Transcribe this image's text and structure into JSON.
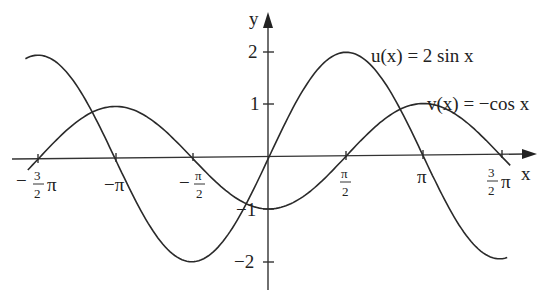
{
  "chart_data": {
    "type": "line",
    "title": "",
    "xlabel": "x",
    "ylabel": "y",
    "xlim": [
      -4.87,
      4.89
    ],
    "ylim": [
      -2.5,
      2.2
    ],
    "grid": false,
    "legend": "inline labels",
    "x_ticks": [
      {
        "value": -4.712,
        "num": "3",
        "den": "2",
        "label": "-3/2 π"
      },
      {
        "value": -3.1416,
        "label": "−π"
      },
      {
        "value": -1.5708,
        "num": "π",
        "den": "2",
        "label": "-π/2"
      },
      {
        "value": 1.5708,
        "num": "π",
        "den": "2",
        "label": "π/2"
      },
      {
        "value": 3.1416,
        "label": "π"
      },
      {
        "value": 4.712,
        "num": "3",
        "den": "2",
        "label": "3/2 π"
      }
    ],
    "y_ticks": [
      {
        "value": 2,
        "label": "2"
      },
      {
        "value": 1,
        "label": "1"
      },
      {
        "value": -1,
        "label": "−1"
      },
      {
        "value": -2,
        "label": "−2"
      }
    ],
    "series": [
      {
        "name": "u(x) = 2 sin x",
        "function": "2*sin(x)",
        "x_range": [
          -4.97,
          4.86
        ],
        "points": [
          [
            -4.712,
            2
          ],
          [
            -3.1416,
            0
          ],
          [
            -1.5708,
            -2
          ],
          [
            0,
            0
          ],
          [
            1.5708,
            2
          ],
          [
            3.1416,
            0
          ],
          [
            4.712,
            -2
          ]
        ]
      },
      {
        "name": "v(x) = −cos x",
        "function": "-cos(x)",
        "x_range": [
          -4.92,
          4.92
        ],
        "points": [
          [
            -4.712,
            0
          ],
          [
            -3.1416,
            1
          ],
          [
            -1.5708,
            0
          ],
          [
            0,
            -1
          ],
          [
            1.5708,
            0
          ],
          [
            3.1416,
            1
          ],
          [
            4.712,
            0
          ]
        ]
      }
    ],
    "labels": {
      "u": "u(x) = 2 sin x",
      "v": "v(x) = −cos x"
    }
  },
  "axis": {
    "x_label": "x",
    "y_label": "y",
    "tick_neg_3pi2_sign": "−",
    "tick_neg_3pi2_num": "3",
    "tick_neg_3pi2_den": "2",
    "tick_neg_3pi2_pi": "π",
    "tick_neg_pi": "−π",
    "tick_neg_pi2_sign": "−",
    "tick_neg_pi2_num": "π",
    "tick_neg_pi2_den": "2",
    "tick_pi2_num": "π",
    "tick_pi2_den": "2",
    "tick_pi": "π",
    "tick_3pi2_num": "3",
    "tick_3pi2_den": "2",
    "tick_3pi2_pi": "π",
    "y_tick_2": "2",
    "y_tick_1": "1",
    "y_tick_m1": "−1",
    "y_tick_m2": "−2"
  }
}
